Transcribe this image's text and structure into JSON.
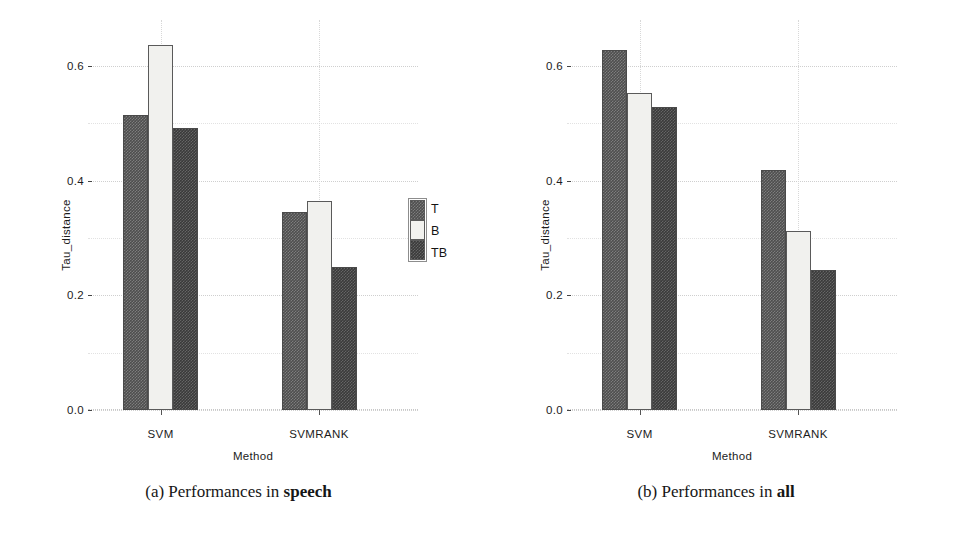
{
  "figure": {
    "panels": [
      {
        "id": "speech",
        "caption_prefix": "(a) Performances in ",
        "caption_emphasis": "speech"
      },
      {
        "id": "all",
        "caption_prefix": "(b) Performances in ",
        "caption_emphasis": "all"
      }
    ]
  },
  "legend": {
    "entries": [
      {
        "label": "T",
        "color": "#4e4e4e"
      },
      {
        "label": "B",
        "color": "#f1f1ee"
      },
      {
        "label": "TB",
        "color": "#3a3a3a"
      }
    ]
  },
  "axis": {
    "ylabel": "Tau_distance",
    "xlabel": "Method",
    "yticks": [
      "0.0",
      "0.2",
      "0.4",
      "0.6"
    ],
    "xticks": [
      "SVM",
      "SVMRANK"
    ]
  },
  "chart_data": [
    {
      "type": "bar",
      "title": "(a) Performances in speech",
      "xlabel": "Method",
      "ylabel": "Tau_distance",
      "categories": [
        "SVM",
        "SVMRANK"
      ],
      "series": [
        {
          "name": "T",
          "values": [
            0.515,
            0.345
          ]
        },
        {
          "name": "B",
          "values": [
            0.637,
            0.365
          ]
        },
        {
          "name": "TB",
          "values": [
            0.492,
            0.25
          ]
        }
      ],
      "ylim": [
        0.0,
        0.68
      ],
      "yticks": [
        0.0,
        0.2,
        0.4,
        0.6
      ],
      "grid": true,
      "legend_position": "right"
    },
    {
      "type": "bar",
      "title": "(b) Performances in all",
      "xlabel": "Method",
      "ylabel": "Tau_distance",
      "categories": [
        "SVM",
        "SVMRANK"
      ],
      "series": [
        {
          "name": "T",
          "values": [
            0.628,
            0.418
          ]
        },
        {
          "name": "B",
          "values": [
            0.552,
            0.313
          ]
        },
        {
          "name": "TB",
          "values": [
            0.528,
            0.245
          ]
        }
      ],
      "ylim": [
        0.0,
        0.68
      ],
      "yticks": [
        0.0,
        0.2,
        0.4,
        0.6
      ],
      "grid": true,
      "legend_position": "right"
    }
  ]
}
